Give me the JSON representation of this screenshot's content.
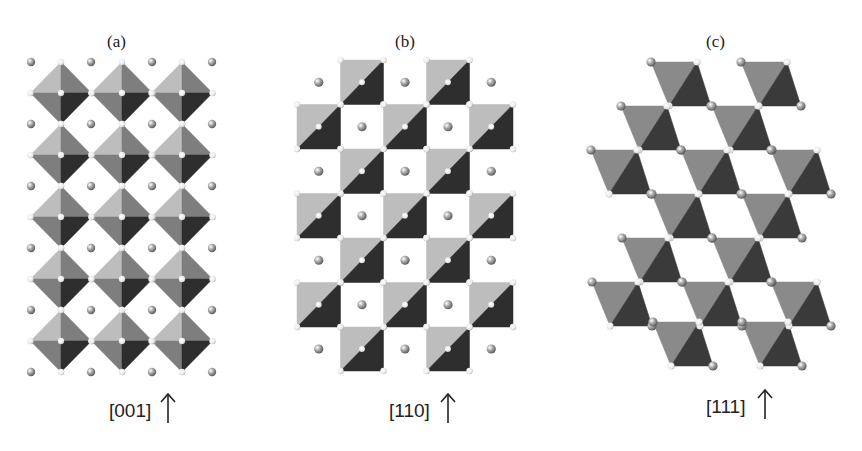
{
  "figure": {
    "panels": [
      {
        "id": "a",
        "title": "(a)",
        "direction_label": "[001]",
        "arrow": "↑",
        "structure": "corner-sharing octahedra (perovskite-like)"
      },
      {
        "id": "b",
        "title": "(b)",
        "direction_label": "[110]",
        "arrow": "↑",
        "structure": "octahedra viewed along [110]"
      },
      {
        "id": "c",
        "title": "(c)",
        "direction_label": "[111]",
        "arrow": "↑",
        "structure": "octahedra viewed along [111]"
      }
    ],
    "colors": {
      "light_face": "#bdbdbd",
      "mid_face": "#7e7e7e",
      "dark_face": "#2e2e2e",
      "c_light_face": "#8a8a8a",
      "c_dark_face": "#3a3a3a",
      "sphere": "#9a9a9a",
      "anion": "#f2f2f2",
      "text": "#222222"
    }
  }
}
